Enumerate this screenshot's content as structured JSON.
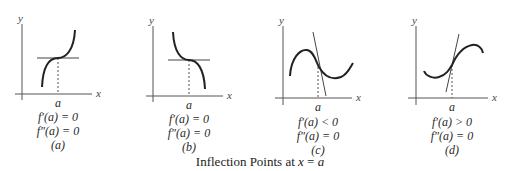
{
  "caption": {
    "prefix": "Inflection Points at ",
    "var": "x",
    "eq": " = ",
    "val": "a"
  },
  "axis_labels": {
    "x": "x",
    "y": "y",
    "point": "a"
  },
  "panels": [
    {
      "id": "a",
      "tag": "(a)",
      "cond1": "f′(a) = 0",
      "cond2": "f″(a) = 0",
      "description": "increasing curve with horizontal tangent at inflection"
    },
    {
      "id": "b",
      "tag": "(b)",
      "cond1": "f′(a) = 0",
      "cond2": "f″(a) = 0",
      "description": "decreasing curve with horizontal tangent at inflection"
    },
    {
      "id": "c",
      "tag": "(c)",
      "cond1": "f′(a) < 0",
      "cond2": "f″(a) = 0",
      "description": "curve with local max then min; negative-slope tangent at inflection"
    },
    {
      "id": "d",
      "tag": "(d)",
      "cond1": "f′(a) > 0",
      "cond2": "f″(a) = 0",
      "description": "curve with local min then max; positive-slope tangent at inflection"
    }
  ],
  "colors": {
    "curve": "#222222",
    "axis": "#555555",
    "tangent": "#444444"
  }
}
